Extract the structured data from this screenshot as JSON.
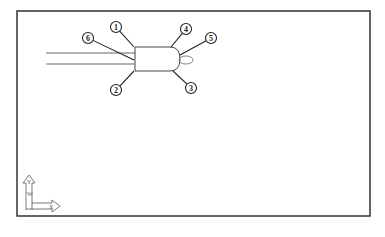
{
  "diagram": {
    "type": "cad-part-callout",
    "balloons": [
      {
        "label": "1",
        "cx": 116,
        "cy": 27,
        "lx": 134,
        "ly": 47
      },
      {
        "label": "6",
        "cx": 88,
        "cy": 38,
        "lx": 134,
        "ly": 60
      },
      {
        "label": "4",
        "cx": 186,
        "cy": 29,
        "lx": 171,
        "ly": 47
      },
      {
        "label": "5",
        "cx": 211,
        "cy": 38,
        "lx": 180,
        "ly": 55
      },
      {
        "label": "2",
        "cx": 116,
        "cy": 90,
        "lx": 134,
        "ly": 71
      },
      {
        "label": "3",
        "cx": 191,
        "cy": 88,
        "lx": 173,
        "ly": 71
      }
    ],
    "ucs": {
      "x_label": "X",
      "y_label": "Y",
      "w_label": "W"
    }
  },
  "colors": {
    "line": "#222222",
    "border": "#333333",
    "background": "#ffffff"
  }
}
